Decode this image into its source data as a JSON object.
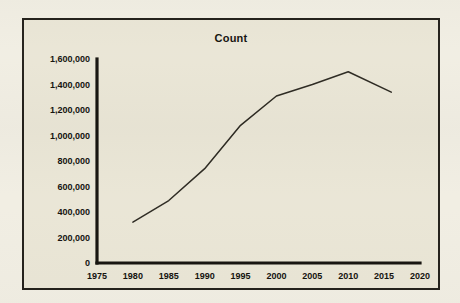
{
  "chart_data": {
    "type": "line",
    "title": "Count",
    "xlabel": "",
    "ylabel": "",
    "xlim": [
      1975,
      2020
    ],
    "ylim": [
      0,
      1600000
    ],
    "grid": false,
    "legend": null,
    "x_ticks": [
      "1975",
      "1980",
      "1985",
      "1990",
      "1995",
      "2000",
      "2005",
      "2010",
      "2015",
      "2020"
    ],
    "y_ticks": [
      "0",
      "200,000",
      "400,000",
      "600,000",
      "800,000",
      "1,000,000",
      "1,200,000",
      "1,400,000",
      "1,600,000"
    ],
    "x": [
      1980,
      1985,
      1990,
      1995,
      2000,
      2005,
      2010,
      2016
    ],
    "series": [
      {
        "name": "Count",
        "values": [
          320000,
          490000,
          740000,
          1080000,
          1310000,
          1400000,
          1500000,
          1340000
        ],
        "color": "#2d2a22"
      }
    ]
  },
  "style": {
    "page_background": "#f1eee3",
    "plot_background": "#eae6d6",
    "frame_color": "#24211b",
    "axis_color": "#16140f",
    "text_color": "#14120e"
  }
}
